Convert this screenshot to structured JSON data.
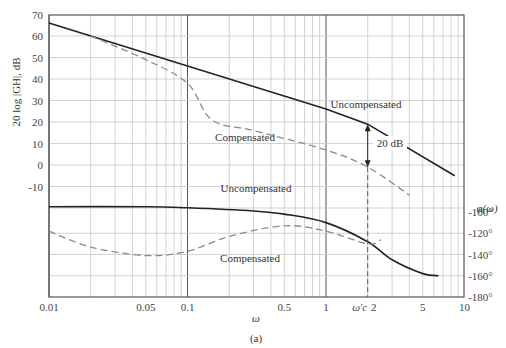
{
  "chart_data": {
    "type": "line",
    "title": "",
    "caption": "(a)",
    "xlabel": "ω",
    "ylabel": "20 log |GH|, dB",
    "ylabel_right": "φ(ω)",
    "xscale": "log",
    "xlim": [
      0.01,
      10
    ],
    "ylim": [
      -20,
      70
    ],
    "ylim_right_deg": [
      -180,
      -100
    ],
    "grid": true,
    "x_tick_labels": [
      "0.01",
      "0.05",
      "0.1",
      "0.5",
      "1",
      "ω′c 2",
      "5",
      "10"
    ],
    "x_ticks": [
      0.01,
      0.05,
      0.1,
      0.5,
      1,
      2,
      5,
      10
    ],
    "y_tick_labels": [
      "70",
      "60",
      "50",
      "40",
      "30",
      "20",
      "10",
      "0",
      "-10"
    ],
    "y_ticks": [
      70,
      60,
      50,
      40,
      30,
      20,
      10,
      0,
      -10
    ],
    "y_right_tick_labels": [
      "-100°",
      "-120°",
      "-140°",
      "-160°",
      "-180°"
    ],
    "y_right_ticks": [
      -100,
      -120,
      -140,
      -160,
      -180
    ],
    "annotations": [
      {
        "text": "Uncompensated",
        "near": "magnitude curve at ω≈3"
      },
      {
        "text": "Compensated",
        "near": "magnitude curve at ω≈0.25"
      },
      {
        "text": "Uncompensated",
        "near": "phase curve at ω≈0.3"
      },
      {
        "text": "Compensated",
        "near": "phase curve at ω≈0.3"
      },
      {
        "text": "20 dB",
        "near": "double arrow at ω′c≈2 between curves"
      }
    ],
    "series": [
      {
        "name": "Uncompensated magnitude (dB)",
        "style": "solid",
        "x": [
          0.01,
          0.1,
          1,
          2,
          8.5
        ],
        "values": [
          66,
          46,
          26,
          19,
          -5
        ]
      },
      {
        "name": "Compensated magnitude (dB)",
        "style": "dashed",
        "x": [
          0.02,
          0.05,
          0.1,
          0.15,
          0.3,
          1,
          2,
          4
        ],
        "values": [
          60,
          49,
          38,
          21,
          16,
          7,
          -1,
          -14
        ]
      },
      {
        "name": "Uncompensated phase (deg)",
        "style": "solid",
        "x": [
          0.01,
          0.05,
          0.1,
          0.3,
          0.5,
          1,
          2,
          3,
          5,
          6.5
        ],
        "values": [
          -95,
          -95,
          -96,
          -99,
          -102,
          -110,
          -128,
          -145,
          -158,
          -160
        ]
      },
      {
        "name": "Compensated phase (deg)",
        "style": "dashed",
        "x": [
          0.01,
          0.02,
          0.05,
          0.1,
          0.2,
          0.5,
          1,
          2,
          2.5
        ],
        "values": [
          -118,
          -133,
          -141,
          -137,
          -123,
          -113,
          -118,
          -130,
          -126
        ]
      }
    ],
    "crossover": {
      "label": "ω′c",
      "x": 2,
      "gap_db": 20
    }
  }
}
